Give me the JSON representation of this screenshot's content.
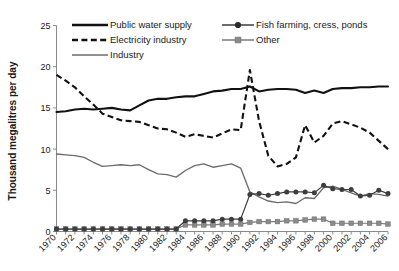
{
  "chart_data": {
    "type": "line",
    "title": "",
    "xlabel": "",
    "ylabel": "Thousand megalitres per day",
    "ylim": [
      0,
      25
    ],
    "yticks": [
      0,
      5,
      10,
      15,
      20,
      25
    ],
    "xlim": [
      1970,
      2006
    ],
    "grid": false,
    "legend_position": "top",
    "x": [
      1970,
      1971,
      1972,
      1973,
      1974,
      1975,
      1976,
      1977,
      1978,
      1979,
      1980,
      1981,
      1982,
      1983,
      1984,
      1985,
      1986,
      1987,
      1988,
      1989,
      1990,
      1991,
      1992,
      1993,
      1994,
      1995,
      1996,
      1997,
      1998,
      1999,
      2000,
      2001,
      2002,
      2003,
      2004,
      2005,
      2006
    ],
    "xtick_labels": [
      "1970",
      "1972",
      "1974",
      "1976",
      "1978",
      "1980",
      "1982",
      "1984",
      "1986",
      "1988",
      "1990",
      "1992",
      "1994",
      "1996",
      "1998",
      "2000",
      "2002",
      "2004",
      "2006"
    ],
    "series": [
      {
        "name": "Public water supply",
        "style": "solid-black",
        "color": "#111111",
        "marker": "none",
        "values": [
          14.5,
          14.6,
          14.8,
          14.9,
          14.8,
          14.9,
          15.0,
          14.8,
          14.7,
          15.3,
          15.9,
          16.1,
          16.1,
          16.3,
          16.4,
          16.4,
          16.7,
          17.0,
          17.1,
          17.3,
          17.3,
          17.6,
          17.0,
          17.2,
          17.3,
          17.3,
          17.2,
          16.8,
          17.1,
          16.8,
          17.3,
          17.4,
          17.4,
          17.5,
          17.5,
          17.6,
          17.6
        ]
      },
      {
        "name": "Electricity industry",
        "style": "dashed-black",
        "color": "#111111",
        "marker": "none",
        "values": [
          19.0,
          18.3,
          17.5,
          16.4,
          15.4,
          14.3,
          13.9,
          13.5,
          13.4,
          13.3,
          12.9,
          12.5,
          12.4,
          12.0,
          11.5,
          11.8,
          11.6,
          11.4,
          11.9,
          12.4,
          12.3,
          19.6,
          13.4,
          9.2,
          7.9,
          8.2,
          9.0,
          12.9,
          10.8,
          11.6,
          13.1,
          13.4,
          13.0,
          12.6,
          12.0,
          11.0,
          10.0
        ]
      },
      {
        "name": "Industry",
        "style": "solid-gray",
        "color": "#6b6b6b",
        "marker": "none",
        "values": [
          9.4,
          9.3,
          9.2,
          9.0,
          8.4,
          7.9,
          8.0,
          8.1,
          8.0,
          8.1,
          7.5,
          7.0,
          6.9,
          6.6,
          7.4,
          8.0,
          8.2,
          7.8,
          8.0,
          8.2,
          7.7,
          4.8,
          4.2,
          3.7,
          3.5,
          3.6,
          3.4,
          4.1,
          4.0,
          5.3,
          5.5,
          5.1,
          4.7,
          4.3,
          4.6,
          4.5,
          4.3
        ]
      },
      {
        "name": "Fish farming, cress, ponds",
        "style": "solid-circle",
        "color": "#3d3d3d",
        "marker": "circle",
        "values": [
          0.3,
          0.3,
          0.3,
          0.3,
          0.3,
          0.3,
          0.3,
          0.3,
          0.3,
          0.3,
          0.3,
          0.3,
          0.3,
          0.3,
          1.3,
          1.3,
          1.3,
          1.3,
          1.5,
          1.5,
          1.5,
          4.5,
          4.6,
          4.4,
          4.6,
          4.8,
          4.8,
          4.8,
          4.7,
          5.6,
          5.2,
          5.1,
          5.1,
          4.3,
          4.4,
          5.0,
          4.6
        ]
      },
      {
        "name": "Other",
        "style": "solid-square",
        "color": "#8a8a8a",
        "marker": "square",
        "values": [
          0.3,
          0.3,
          0.3,
          0.3,
          0.3,
          0.3,
          0.3,
          0.3,
          0.3,
          0.3,
          0.3,
          0.3,
          0.3,
          0.3,
          0.8,
          0.8,
          0.8,
          0.8,
          0.9,
          0.9,
          0.9,
          1.1,
          1.2,
          1.2,
          1.2,
          1.3,
          1.3,
          1.4,
          1.5,
          1.5,
          1.0,
          1.0,
          1.0,
          1.0,
          1.0,
          1.0,
          0.9
        ]
      }
    ]
  },
  "legend": {
    "entries": [
      {
        "label": "Public water supply"
      },
      {
        "label": "Electricity industry"
      },
      {
        "label": "Industry"
      },
      {
        "label": "Fish farming, cress, ponds"
      },
      {
        "label": "Other"
      }
    ]
  }
}
